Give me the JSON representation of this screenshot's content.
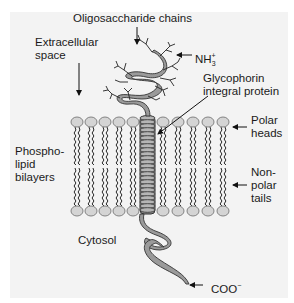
{
  "diagram": {
    "labels": {
      "oligosaccharide": "Oligosaccharide chains",
      "extracellular_1": "Extracellular",
      "extracellular_2": "space",
      "nh3_base": "NH",
      "nh3_sub": "3",
      "nh3_sup": "+",
      "glycophorin_1": "Glycophorin",
      "glycophorin_2": "integral protein",
      "polar_1": "Polar",
      "polar_2": "heads",
      "phospho_1": "Phospho-",
      "phospho_2": "lipid",
      "phospho_3": "bilayers",
      "nonpolar_1": "Non-",
      "nonpolar_2": "polar",
      "nonpolar_3": "tails",
      "cytosol": "Cytosol",
      "coo_base": "COO",
      "coo_sup": "−"
    },
    "colors": {
      "background": "#f3f3f3",
      "head_fill": "#d4d4d4",
      "head_stroke": "#777777",
      "protein_fill": "#9a9a9a",
      "protein_stroke": "#333333",
      "line": "#111111"
    },
    "lipid_columns_left": [
      77,
      91,
      105,
      119,
      133
    ],
    "lipid_columns_right": [
      163,
      178,
      193,
      208,
      223
    ],
    "bilayer": {
      "top_head_y": 122,
      "bottom_head_y": 211
    }
  }
}
